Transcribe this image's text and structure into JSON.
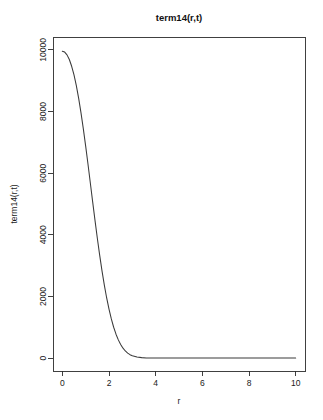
{
  "chart_data": {
    "type": "line",
    "title": "term14(r,t)",
    "xlabel": "r",
    "ylabel": "term14(r,t)",
    "xlim": [
      -0.4,
      10.4
    ],
    "ylim": [
      -420,
      10420
    ],
    "xticks": [
      0,
      2,
      4,
      6,
      8,
      10
    ],
    "yticks": [
      0,
      2000,
      4000,
      6000,
      8000,
      10000
    ],
    "xtick_labels": [
      "0",
      "2",
      "4",
      "6",
      "8",
      "10"
    ],
    "ytick_labels": [
      "0",
      "2000",
      "4000",
      "6000",
      "8000",
      "10000"
    ],
    "grid": false,
    "legend": null,
    "box": true,
    "line_color": "#3a3a3a",
    "background_color": "#ffffff",
    "series": [
      {
        "name": "term14",
        "x": [
          0.0,
          0.1,
          0.2,
          0.3,
          0.4,
          0.5,
          0.6,
          0.7,
          0.8,
          0.9,
          1.0,
          1.1,
          1.2,
          1.3,
          1.4,
          1.5,
          1.6,
          1.7,
          1.8,
          1.9,
          2.0,
          2.1,
          2.2,
          2.3,
          2.4,
          2.5,
          2.6,
          2.7,
          2.8,
          2.9,
          3.0,
          3.2,
          3.4,
          3.6,
          3.8,
          4.0,
          4.5,
          5.0,
          5.5,
          6.0,
          6.5,
          7.0,
          7.5,
          8.0,
          8.5,
          9.0,
          9.5,
          10.0
        ],
        "y": [
          9960,
          9930,
          9840,
          9690,
          9470,
          9190,
          8840,
          8430,
          7960,
          7440,
          6880,
          6290,
          5680,
          5070,
          4470,
          3890,
          3340,
          2830,
          2370,
          1950,
          1590,
          1270,
          1000,
          775,
          590,
          440,
          320,
          230,
          160,
          110,
          75,
          33,
          14,
          5,
          2,
          1,
          0,
          0,
          0,
          0,
          0,
          0,
          0,
          0,
          0,
          0,
          0,
          0
        ]
      }
    ]
  },
  "plot_geometry": {
    "box_left": 53,
    "box_right": 305,
    "box_top": 37,
    "box_bottom": 371,
    "title_x": 179,
    "title_y": 21,
    "xlabel_x": 179,
    "xlabel_y": 404,
    "ylabel_x": 17,
    "ylabel_y": 204
  }
}
